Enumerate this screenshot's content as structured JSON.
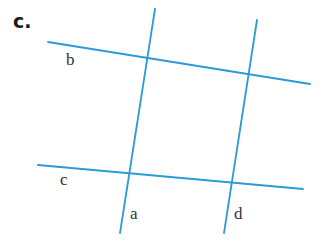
{
  "part_label": "c.",
  "line_color": "#2a9ad8",
  "lines": [
    {
      "name": "b",
      "x1": 48,
      "y1": 42,
      "x2": 310,
      "y2": 84
    },
    {
      "name": "c",
      "x1": 38,
      "y1": 165,
      "x2": 303,
      "y2": 189
    },
    {
      "name": "a",
      "x1": 155,
      "y1": 9,
      "x2": 120,
      "y2": 233
    },
    {
      "name": "d",
      "x1": 257,
      "y1": 20,
      "x2": 224,
      "y2": 233
    }
  ],
  "labels": {
    "b": "b",
    "c": "c",
    "a": "a",
    "d": "d"
  }
}
